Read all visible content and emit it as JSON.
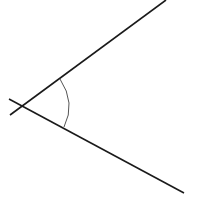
{
  "diagram": {
    "type": "angle",
    "background": "#ffffff",
    "stroke_color": "#1a1a1a",
    "arc_color": "#555555",
    "lines": [
      {
        "name": "upper-ray",
        "x1": 10,
        "y1": 115,
        "x2": 166,
        "y2": 0,
        "width": 1.6
      },
      {
        "name": "lower-ray",
        "x1": 9,
        "y1": 99,
        "x2": 184,
        "y2": 193,
        "width": 1.6
      }
    ],
    "vertex": {
      "x": 22,
      "y": 106
    },
    "arc": {
      "start_x": 60,
      "start_y": 79,
      "ctrl_x": 76,
      "ctrl_y": 103,
      "end_x": 64,
      "end_y": 127,
      "width": 1
    }
  }
}
